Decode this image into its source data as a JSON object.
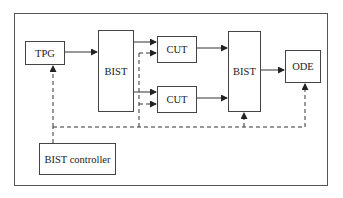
{
  "diagram": {
    "type": "block-diagram",
    "blocks": {
      "tpg": {
        "label": "TPG"
      },
      "bist_in": {
        "label": "BIST"
      },
      "cut_top": {
        "label": "CUT"
      },
      "cut_bottom": {
        "label": "CUT"
      },
      "bist_out": {
        "label": "BIST"
      },
      "ode": {
        "label": "ODE"
      },
      "controller": {
        "label": "BIST controller"
      }
    },
    "connections": [
      {
        "from": "TPG",
        "to": "BIST",
        "style": "solid"
      },
      {
        "from": "BIST",
        "to": "CUT (top)",
        "style": "solid"
      },
      {
        "from": "BIST",
        "to": "CUT (bottom)",
        "style": "solid"
      },
      {
        "from": "CUT (top)",
        "to": "BIST (output)",
        "style": "solid"
      },
      {
        "from": "CUT (bottom)",
        "to": "BIST (output)",
        "style": "solid"
      },
      {
        "from": "BIST (output)",
        "to": "ODE",
        "style": "solid"
      },
      {
        "from": "BIST controller",
        "to": "TPG",
        "style": "dashed"
      },
      {
        "from": "BIST controller",
        "to": "CUT (top)",
        "style": "dashed"
      },
      {
        "from": "BIST controller",
        "to": "CUT (bottom)",
        "style": "dashed"
      },
      {
        "from": "BIST controller",
        "to": "BIST (output)",
        "style": "dashed"
      },
      {
        "from": "BIST controller",
        "to": "ODE",
        "style": "dashed"
      }
    ],
    "colors": {
      "line": "#333333",
      "border": "#444444",
      "background": "#ffffff"
    }
  }
}
